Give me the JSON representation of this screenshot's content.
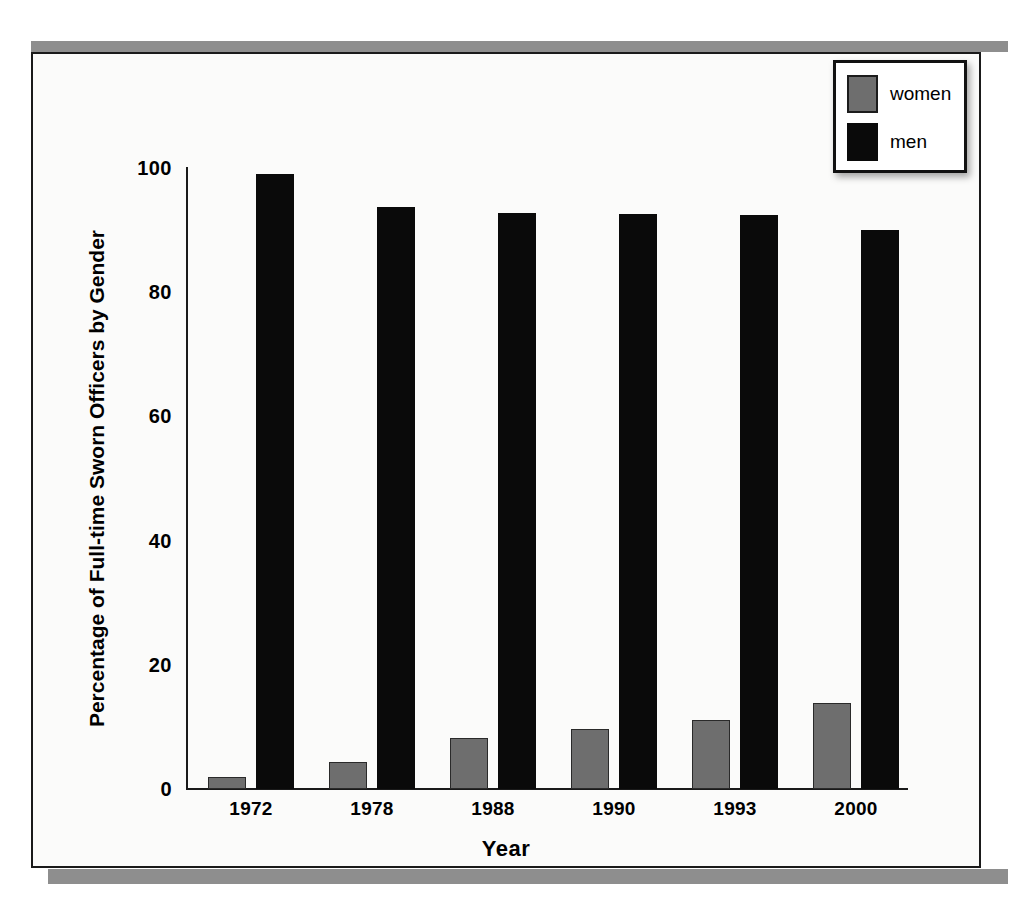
{
  "figure": {
    "legend_position": "top-right",
    "colors": {
      "women": "#6e6e6e",
      "men": "#0a0a0a",
      "axis": "#1a1a1a",
      "band": "#8e8e8e",
      "paper": "#fbfbfa"
    }
  },
  "legend": {
    "entries": [
      {
        "label": "women",
        "color": "#6e6e6e"
      },
      {
        "label": "men",
        "color": "#0a0a0a"
      }
    ]
  },
  "chart_data": {
    "type": "bar",
    "title": "",
    "xlabel": "Year",
    "ylabel": "Percentage of Full-time Sworn Officers by Gender",
    "categories": [
      "1972",
      "1978",
      "1988",
      "1990",
      "1993",
      "2000"
    ],
    "series": [
      {
        "name": "women",
        "color": "#6e6e6e",
        "values": [
          2,
          4.3,
          8.2,
          9.7,
          11.1,
          13.8
        ]
      },
      {
        "name": "men",
        "color": "#0a0a0a",
        "values": [
          99,
          93.8,
          92.8,
          92.6,
          92.4,
          90
        ]
      }
    ],
    "ylim": [
      0,
      100
    ],
    "yticks": [
      0,
      20,
      40,
      60,
      80,
      100
    ],
    "ytick_labels": [
      "0",
      "20",
      "40",
      "60",
      "80",
      "100"
    ],
    "grid": false,
    "legend": [
      "women",
      "men"
    ]
  }
}
